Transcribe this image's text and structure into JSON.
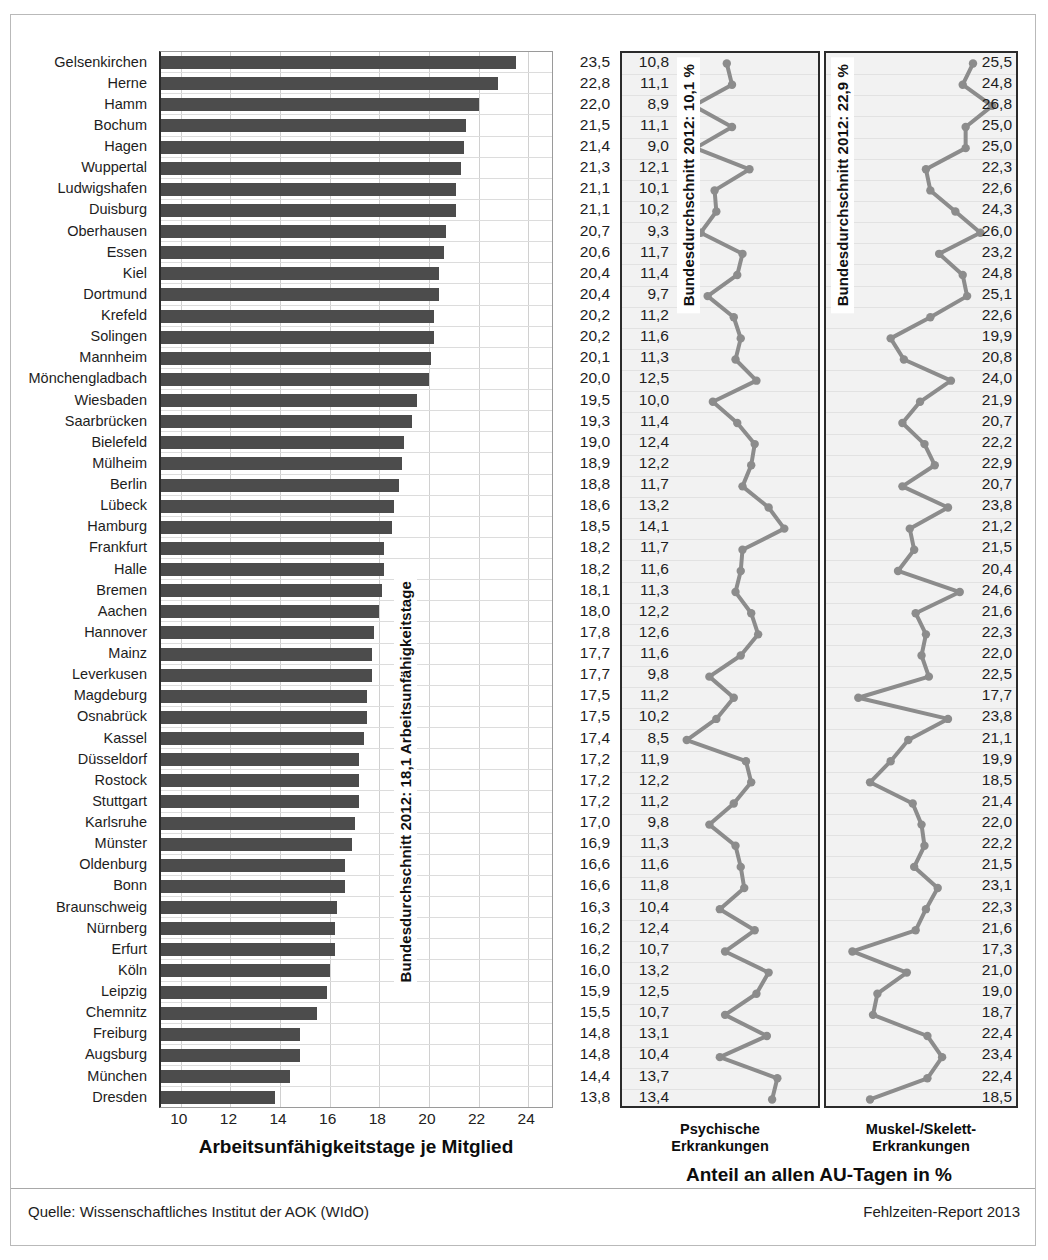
{
  "footer": {
    "source": "Quelle: Wissenschaftliches Institut der AOK (WIdO)",
    "report": "Fehlzeiten-Report 2013"
  },
  "left_panel": {
    "axis_title": "Arbeitsunfähigkeitstage je Mitglied",
    "average_caption": "Bundesdurchschnitt 2012: 18,1 Arbeitsunfähigkeitstage",
    "xticks": [
      10,
      12,
      14,
      16,
      18,
      20,
      22,
      24
    ]
  },
  "psy_panel": {
    "title_line1": "Psychische",
    "title_line2": "Erkrankungen",
    "average_caption": "Bundesdurchschnitt 2012: 10,1 %"
  },
  "mus_panel": {
    "title_line1": "Muskel-/Skelett-",
    "title_line2": "Erkrankungen",
    "average_caption": "Bundesdurchschnitt 2012: 22,9 %"
  },
  "pct_title": "Anteil an allen AU-Tagen in %",
  "chart_data": {
    "type": "bar",
    "xlabel": "Arbeitsunfähigkeitstage je Mitglied",
    "ylabel": "",
    "xlim": [
      9.2,
      25.0
    ],
    "grid": true,
    "categories": [
      "Gelsenkirchen",
      "Herne",
      "Hamm",
      "Bochum",
      "Hagen",
      "Wuppertal",
      "Ludwigshafen",
      "Duisburg",
      "Oberhausen",
      "Essen",
      "Kiel",
      "Dortmund",
      "Krefeld",
      "Solingen",
      "Mannheim",
      "Mönchengladbach",
      "Wiesbaden",
      "Saarbrücken",
      "Bielefeld",
      "Mülheim",
      "Berlin",
      "Lübeck",
      "Hamburg",
      "Frankfurt",
      "Halle",
      "Bremen",
      "Aachen",
      "Hannover",
      "Mainz",
      "Leverkusen",
      "Magdeburg",
      "Osnabrück",
      "Kassel",
      "Düsseldorf",
      "Rostock",
      "Stuttgart",
      "Karlsruhe",
      "Münster",
      "Oldenburg",
      "Bonn",
      "Braunschweig",
      "Nürnberg",
      "Erfurt",
      "Köln",
      "Leipzig",
      "Chemnitz",
      "Freiburg",
      "Augsburg",
      "München",
      "Dresden"
    ],
    "series": [
      {
        "name": "Arbeitsunfähigkeitstage je Mitglied",
        "unit": "Tage",
        "average": 18.1,
        "values": [
          23.5,
          22.8,
          22.0,
          21.5,
          21.4,
          21.3,
          21.1,
          21.1,
          20.7,
          20.6,
          20.4,
          20.4,
          20.2,
          20.2,
          20.1,
          20.0,
          19.5,
          19.3,
          19.0,
          18.9,
          18.8,
          18.6,
          18.5,
          18.2,
          18.2,
          18.1,
          18.0,
          17.8,
          17.7,
          17.7,
          17.5,
          17.5,
          17.4,
          17.2,
          17.2,
          17.2,
          17.0,
          16.9,
          16.6,
          16.6,
          16.3,
          16.2,
          16.2,
          16.0,
          15.9,
          15.5,
          14.8,
          14.8,
          14.4,
          13.8
        ],
        "labels": [
          "23,5",
          "22,8",
          "22,0",
          "21,5",
          "21,4",
          "21,3",
          "21,1",
          "21,1",
          "20,7",
          "20,6",
          "20,4",
          "20,4",
          "20,2",
          "20,2",
          "20,1",
          "20,0",
          "19,5",
          "19,3",
          "19,0",
          "18,9",
          "18,8",
          "18,6",
          "18,5",
          "18,2",
          "18,2",
          "18,1",
          "18,0",
          "17,8",
          "17,7",
          "17,7",
          "17,5",
          "17,5",
          "17,4",
          "17,2",
          "17,2",
          "17,2",
          "17,0",
          "16,9",
          "16,6",
          "16,6",
          "16,3",
          "16,2",
          "16,2",
          "16,0",
          "15,9",
          "15,5",
          "14,8",
          "14,8",
          "14,4",
          "13,8"
        ]
      },
      {
        "name": "Psychische Erkrankungen",
        "unit": "%",
        "average": 10.1,
        "range": [
          8.0,
          15.0
        ],
        "values": [
          10.8,
          11.1,
          8.9,
          11.1,
          9.0,
          12.1,
          10.1,
          10.2,
          9.3,
          11.7,
          11.4,
          9.7,
          11.2,
          11.6,
          11.3,
          12.5,
          10.0,
          11.4,
          12.4,
          12.2,
          11.7,
          13.2,
          14.1,
          11.7,
          11.6,
          11.3,
          12.2,
          12.6,
          11.6,
          9.8,
          11.2,
          10.2,
          8.5,
          11.9,
          12.2,
          11.2,
          9.8,
          11.3,
          11.6,
          11.8,
          10.4,
          12.4,
          10.7,
          13.2,
          12.5,
          10.7,
          13.1,
          10.4,
          13.7,
          13.4
        ],
        "labels": [
          "10,8",
          "11,1",
          "8,9",
          "11,1",
          "9,0",
          "12,1",
          "10,1",
          "10,2",
          "9,3",
          "11,7",
          "11,4",
          "9,7",
          "11,2",
          "11,6",
          "11,3",
          "12,5",
          "10,0",
          "11,4",
          "12,4",
          "12,2",
          "11,7",
          "13,2",
          "14,1",
          "11,7",
          "11,6",
          "11,3",
          "12,2",
          "12,6",
          "11,6",
          "9,8",
          "11,2",
          "10,2",
          "8,5",
          "11,9",
          "12,2",
          "11,2",
          "9,8",
          "11,3",
          "11,6",
          "11,8",
          "10,4",
          "12,4",
          "10,7",
          "13,2",
          "12,5",
          "10,7",
          "13,1",
          "10,4",
          "13,7",
          "13,4"
        ]
      },
      {
        "name": "Muskel-/Skelett-Erkrankungen",
        "unit": "%",
        "average": 22.9,
        "range": [
          17.0,
          27.2
        ],
        "values": [
          25.5,
          24.8,
          26.8,
          25.0,
          25.0,
          22.3,
          22.6,
          24.3,
          26.0,
          23.2,
          24.8,
          25.1,
          22.6,
          19.9,
          20.8,
          24.0,
          21.9,
          20.7,
          22.2,
          22.9,
          20.7,
          23.8,
          21.2,
          21.5,
          20.4,
          24.6,
          21.6,
          22.3,
          22.0,
          22.5,
          17.7,
          23.8,
          21.1,
          19.9,
          18.5,
          21.4,
          22.0,
          22.2,
          21.5,
          23.1,
          22.3,
          21.6,
          17.3,
          21.0,
          19.0,
          18.7,
          22.4,
          23.4,
          22.4,
          18.5
        ],
        "labels": [
          "25,5",
          "24,8",
          "26,8",
          "25,0",
          "25,0",
          "22,3",
          "22,6",
          "24,3",
          "26,0",
          "23,2",
          "24,8",
          "25,1",
          "22,6",
          "19,9",
          "20,8",
          "24,0",
          "21,9",
          "20,7",
          "22,2",
          "22,9",
          "20,7",
          "23,8",
          "21,2",
          "21,5",
          "20,4",
          "24,6",
          "21,6",
          "22,3",
          "22,0",
          "22,5",
          "17,7",
          "23,8",
          "21,1",
          "19,9",
          "18,5",
          "21,4",
          "22,0",
          "22,2",
          "21,5",
          "23,1",
          "22,3",
          "21,6",
          "17,3",
          "21,0",
          "19,0",
          "18,7",
          "22,4",
          "23,4",
          "22,4",
          "18,5"
        ]
      }
    ]
  }
}
